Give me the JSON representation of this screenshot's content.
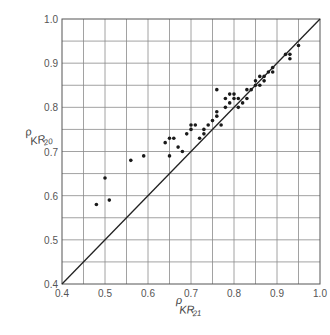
{
  "chart_data": {
    "type": "scatter",
    "title": "",
    "xlabel": "ρ_KR21",
    "ylabel": "ρ_KR20",
    "xlabel_main": "ρ",
    "xlabel_sub": "KR",
    "xlabel_subsub": "21",
    "ylabel_main": "ρ",
    "ylabel_sub": "KR",
    "ylabel_subsub": "20",
    "xlim": [
      0.4,
      1.0
    ],
    "ylim": [
      0.4,
      1.0
    ],
    "grid": true,
    "grid_step": 0.05,
    "x_ticks": [
      "0.4",
      "0.5",
      "0.6",
      "0.7",
      "0.8",
      "0.9",
      "1.0"
    ],
    "y_ticks": [
      "0.4",
      "0.5",
      "0.6",
      "0.7",
      "0.8",
      "0.9",
      "1.0"
    ],
    "reference_line": {
      "label": "y = x",
      "from": [
        0.4,
        0.4
      ],
      "to": [
        1.0,
        1.0
      ]
    },
    "series": [
      {
        "name": "tests",
        "points": [
          [
            0.48,
            0.58
          ],
          [
            0.5,
            0.64
          ],
          [
            0.51,
            0.59
          ],
          [
            0.56,
            0.68
          ],
          [
            0.59,
            0.69
          ],
          [
            0.64,
            0.72
          ],
          [
            0.65,
            0.73
          ],
          [
            0.66,
            0.73
          ],
          [
            0.65,
            0.69
          ],
          [
            0.67,
            0.71
          ],
          [
            0.68,
            0.7
          ],
          [
            0.69,
            0.74
          ],
          [
            0.7,
            0.76
          ],
          [
            0.7,
            0.75
          ],
          [
            0.71,
            0.76
          ],
          [
            0.72,
            0.73
          ],
          [
            0.73,
            0.74
          ],
          [
            0.73,
            0.75
          ],
          [
            0.74,
            0.76
          ],
          [
            0.75,
            0.77
          ],
          [
            0.76,
            0.84
          ],
          [
            0.76,
            0.79
          ],
          [
            0.76,
            0.78
          ],
          [
            0.77,
            0.76
          ],
          [
            0.78,
            0.8
          ],
          [
            0.78,
            0.82
          ],
          [
            0.79,
            0.83
          ],
          [
            0.79,
            0.81
          ],
          [
            0.8,
            0.82
          ],
          [
            0.8,
            0.83
          ],
          [
            0.81,
            0.8
          ],
          [
            0.81,
            0.82
          ],
          [
            0.82,
            0.81
          ],
          [
            0.83,
            0.84
          ],
          [
            0.83,
            0.82
          ],
          [
            0.84,
            0.84
          ],
          [
            0.85,
            0.86
          ],
          [
            0.85,
            0.85
          ],
          [
            0.86,
            0.85
          ],
          [
            0.86,
            0.87
          ],
          [
            0.87,
            0.87
          ],
          [
            0.87,
            0.86
          ],
          [
            0.88,
            0.88
          ],
          [
            0.89,
            0.89
          ],
          [
            0.89,
            0.88
          ],
          [
            0.92,
            0.92
          ],
          [
            0.93,
            0.92
          ],
          [
            0.93,
            0.91
          ],
          [
            0.95,
            0.94
          ]
        ]
      }
    ]
  }
}
